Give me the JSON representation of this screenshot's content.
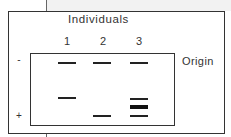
{
  "diagram": {
    "title": "Individuals",
    "origin_label": "Origin",
    "polarity": {
      "negative": "-",
      "positive": "+"
    },
    "lanes": [
      {
        "label": "1",
        "bands": [
          {
            "y": 63,
            "thick": false
          },
          {
            "y": 98,
            "thick": false
          }
        ]
      },
      {
        "label": "2",
        "bands": [
          {
            "y": 63,
            "thick": false
          },
          {
            "y": 116,
            "thick": false
          }
        ]
      },
      {
        "label": "3",
        "bands": [
          {
            "y": 63,
            "thick": false
          },
          {
            "y": 98,
            "thick": false
          },
          {
            "y": 105,
            "thick": true
          },
          {
            "y": 116,
            "thick": false
          }
        ]
      }
    ]
  }
}
